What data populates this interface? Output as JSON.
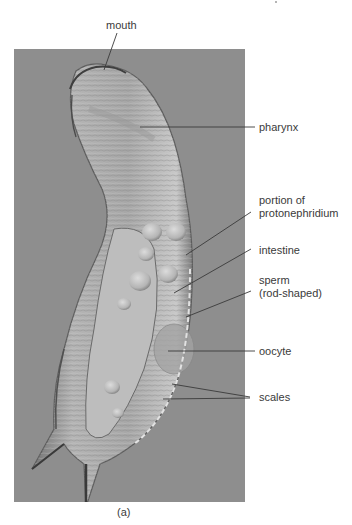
{
  "figure": {
    "panel_label": "(a)",
    "labels": [
      {
        "id": "mouth",
        "text": "mouth"
      },
      {
        "id": "pharynx",
        "text": "pharynx"
      },
      {
        "id": "protonephridium",
        "text": "portion of protonephridium",
        "line1": "portion of",
        "line2": "protonephridium"
      },
      {
        "id": "intestine",
        "text": "intestine"
      },
      {
        "id": "sperm",
        "text": "sperm (rod-shaped)",
        "line1": "sperm",
        "line2": "(rod-shaped)"
      },
      {
        "id": "oocyte",
        "text": "oocyte"
      },
      {
        "id": "scales",
        "text": "scales"
      }
    ],
    "colors": {
      "photo_background": "#8e8e8e",
      "leader_line": "#3a3a3a",
      "label_text": "#3a3a3a"
    }
  }
}
